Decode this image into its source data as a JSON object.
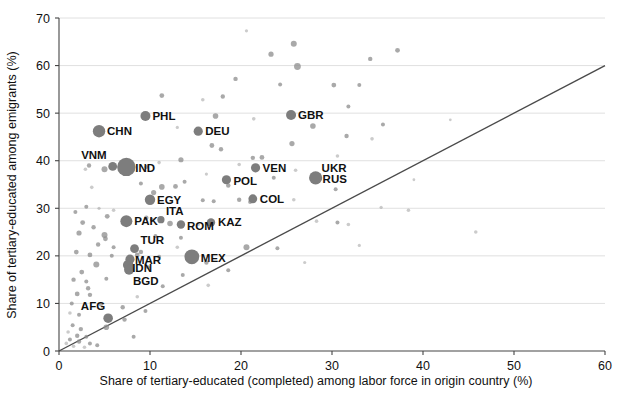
{
  "chart_data": {
    "type": "scatter",
    "title": "",
    "xlabel": "Share of tertiary-educated (completed) among labor force in origin country (%)",
    "ylabel": "Share of tertiary-educated among emigrants (%)",
    "xlim": [
      0,
      60
    ],
    "ylim": [
      0,
      70
    ],
    "xticks": [
      0,
      10,
      20,
      30,
      40,
      50,
      60
    ],
    "yticks": [
      0,
      10,
      20,
      30,
      40,
      50,
      60,
      70
    ],
    "grid": "horizontal",
    "legend": "none",
    "annotations": [
      {
        "label": "45-degree reference line",
        "from": [
          0,
          0
        ],
        "to": [
          60,
          60
        ]
      }
    ],
    "labeled_points": [
      {
        "code": "PHL",
        "x": 9.5,
        "y": 49.4,
        "size": 5.0,
        "label_dx": 7,
        "label_dy": 4
      },
      {
        "code": "CHN",
        "x": 4.4,
        "y": 46.2,
        "size": 6.2,
        "label_dx": 8,
        "label_dy": 4
      },
      {
        "code": "DEU",
        "x": 15.3,
        "y": 46.2,
        "size": 4.6,
        "label_dx": 7,
        "label_dy": 4
      },
      {
        "code": "GBR",
        "x": 25.5,
        "y": 49.6,
        "size": 5.0,
        "label_dx": 7,
        "label_dy": 4
      },
      {
        "code": "VNM",
        "x": 5.9,
        "y": 38.8,
        "size": 4.4,
        "label_dx": -6,
        "label_dy": -7
      },
      {
        "code": "IND",
        "x": 7.4,
        "y": 38.7,
        "size": 9.2,
        "label_dx": 9,
        "label_dy": 5
      },
      {
        "code": "VEN",
        "x": 21.6,
        "y": 38.5,
        "size": 4.6,
        "label_dx": 7,
        "label_dy": 4
      },
      {
        "code": "POL",
        "x": 18.4,
        "y": 36.0,
        "size": 4.6,
        "label_dx": 7,
        "label_dy": 5
      },
      {
        "code": "UKR",
        "x": 28.2,
        "y": 36.4,
        "size": 4.6,
        "label_dx": 6,
        "label_dy": -6
      },
      {
        "code": "RUS",
        "x": 28.2,
        "y": 36.4,
        "size": 6.6,
        "label_dx": 7,
        "label_dy": 5
      },
      {
        "code": "COL",
        "x": 21.3,
        "y": 32.0,
        "size": 4.4,
        "label_dx": 7,
        "label_dy": 4
      },
      {
        "code": "EGY",
        "x": 10.0,
        "y": 31.8,
        "size": 5.2,
        "label_dx": 7,
        "label_dy": 4
      },
      {
        "code": "PAK",
        "x": 7.4,
        "y": 27.3,
        "size": 6.0,
        "label_dx": 8,
        "label_dy": 4
      },
      {
        "code": "ITA",
        "x": 11.2,
        "y": 27.6,
        "size": 3.6,
        "label_dx": 5,
        "label_dy": -5
      },
      {
        "code": "ROM",
        "x": 13.4,
        "y": 26.6,
        "size": 4.2,
        "label_dx": 6,
        "label_dy": 6
      },
      {
        "code": "KAZ",
        "x": 16.7,
        "y": 27.0,
        "size": 4.2,
        "label_dx": 7,
        "label_dy": 3
      },
      {
        "code": "TUR",
        "x": 8.3,
        "y": 21.5,
        "size": 4.4,
        "label_dx": 6,
        "label_dy": -5
      },
      {
        "code": "MAR",
        "x": 7.8,
        "y": 19.3,
        "size": 4.6,
        "label_dx": 5,
        "label_dy": 5
      },
      {
        "code": "MEX",
        "x": 14.6,
        "y": 19.8,
        "size": 7.4,
        "label_dx": 9,
        "label_dy": 5
      },
      {
        "code": "IDN",
        "x": 7.6,
        "y": 18.1,
        "size": 5.2,
        "label_dx": 4,
        "label_dy": 7
      },
      {
        "code": "BGD",
        "x": 7.7,
        "y": 17.1,
        "size": 5.0,
        "label_dx": 4,
        "label_dy": 15
      },
      {
        "code": "AFG",
        "x": 5.4,
        "y": 6.9,
        "size": 4.8,
        "label_dx": -3,
        "label_dy": -8
      }
    ],
    "background_points": [
      {
        "x": 34.2,
        "y": 61.4,
        "size": 2.2
      },
      {
        "x": 37.2,
        "y": 63.2,
        "size": 2.4
      },
      {
        "x": 25.8,
        "y": 64.6,
        "size": 3.0
      },
      {
        "x": 23.3,
        "y": 62.4,
        "size": 2.6
      },
      {
        "x": 26.2,
        "y": 59.8,
        "size": 3.4
      },
      {
        "x": 20.6,
        "y": 67.3,
        "size": 1.6
      },
      {
        "x": 19.4,
        "y": 57.2,
        "size": 2.2
      },
      {
        "x": 24.3,
        "y": 56.0,
        "size": 2.0
      },
      {
        "x": 30.2,
        "y": 55.9,
        "size": 2.4
      },
      {
        "x": 33.0,
        "y": 55.9,
        "size": 2.0
      },
      {
        "x": 11.3,
        "y": 53.7,
        "size": 2.4
      },
      {
        "x": 15.8,
        "y": 52.8,
        "size": 1.8
      },
      {
        "x": 18.0,
        "y": 53.5,
        "size": 2.2
      },
      {
        "x": 31.8,
        "y": 51.4,
        "size": 2.0
      },
      {
        "x": 17.2,
        "y": 49.4,
        "size": 2.8
      },
      {
        "x": 21.4,
        "y": 48.8,
        "size": 1.8
      },
      {
        "x": 27.9,
        "y": 47.3,
        "size": 2.8
      },
      {
        "x": 35.6,
        "y": 47.6,
        "size": 2.0
      },
      {
        "x": 13.0,
        "y": 47.0,
        "size": 1.6
      },
      {
        "x": 31.6,
        "y": 45.2,
        "size": 2.2
      },
      {
        "x": 34.4,
        "y": 44.6,
        "size": 1.8
      },
      {
        "x": 16.8,
        "y": 43.2,
        "size": 2.4
      },
      {
        "x": 17.8,
        "y": 42.4,
        "size": 2.2
      },
      {
        "x": 25.6,
        "y": 43.6,
        "size": 2.6
      },
      {
        "x": 22.3,
        "y": 40.7,
        "size": 2.4
      },
      {
        "x": 21.3,
        "y": 40.6,
        "size": 2.2
      },
      {
        "x": 30.6,
        "y": 41.0,
        "size": 1.8
      },
      {
        "x": 13.4,
        "y": 40.2,
        "size": 2.6
      },
      {
        "x": 11.0,
        "y": 39.6,
        "size": 1.8
      },
      {
        "x": 3.3,
        "y": 39.0,
        "size": 2.2
      },
      {
        "x": 2.9,
        "y": 38.2,
        "size": 1.8
      },
      {
        "x": 5.0,
        "y": 38.2,
        "size": 3.0
      },
      {
        "x": 19.8,
        "y": 39.2,
        "size": 1.8
      },
      {
        "x": 26.0,
        "y": 38.0,
        "size": 1.8
      },
      {
        "x": 9.6,
        "y": 38.7,
        "size": 2.0
      },
      {
        "x": 16.2,
        "y": 37.2,
        "size": 1.6
      },
      {
        "x": 23.6,
        "y": 36.4,
        "size": 2.0
      },
      {
        "x": 13.8,
        "y": 35.6,
        "size": 2.0
      },
      {
        "x": 9.0,
        "y": 35.2,
        "size": 2.0
      },
      {
        "x": 11.3,
        "y": 34.5,
        "size": 2.8
      },
      {
        "x": 12.8,
        "y": 34.6,
        "size": 2.4
      },
      {
        "x": 18.6,
        "y": 34.8,
        "size": 2.2
      },
      {
        "x": 30.4,
        "y": 34.0,
        "size": 2.0
      },
      {
        "x": 3.6,
        "y": 34.4,
        "size": 1.8
      },
      {
        "x": 10.4,
        "y": 33.3,
        "size": 2.6
      },
      {
        "x": 19.8,
        "y": 31.8,
        "size": 2.2
      },
      {
        "x": 21.0,
        "y": 31.3,
        "size": 2.0
      },
      {
        "x": 25.8,
        "y": 31.8,
        "size": 1.8
      },
      {
        "x": 15.8,
        "y": 31.7,
        "size": 2.0
      },
      {
        "x": 17.0,
        "y": 31.5,
        "size": 2.0
      },
      {
        "x": 3.0,
        "y": 30.3,
        "size": 2.0
      },
      {
        "x": 4.4,
        "y": 30.0,
        "size": 1.6
      },
      {
        "x": 6.0,
        "y": 29.6,
        "size": 1.8
      },
      {
        "x": 1.8,
        "y": 29.2,
        "size": 2.0
      },
      {
        "x": 5.3,
        "y": 28.3,
        "size": 2.4
      },
      {
        "x": 9.6,
        "y": 28.0,
        "size": 2.2
      },
      {
        "x": 10.2,
        "y": 27.6,
        "size": 2.0
      },
      {
        "x": 12.2,
        "y": 26.8,
        "size": 2.8
      },
      {
        "x": 15.3,
        "y": 26.6,
        "size": 1.8
      },
      {
        "x": 2.6,
        "y": 27.0,
        "size": 2.4
      },
      {
        "x": 3.8,
        "y": 26.0,
        "size": 2.2
      },
      {
        "x": 28.3,
        "y": 27.3,
        "size": 1.8
      },
      {
        "x": 30.6,
        "y": 27.0,
        "size": 2.0
      },
      {
        "x": 31.8,
        "y": 26.6,
        "size": 1.8
      },
      {
        "x": 2.2,
        "y": 24.8,
        "size": 2.6
      },
      {
        "x": 5.0,
        "y": 24.4,
        "size": 3.0
      },
      {
        "x": 5.1,
        "y": 23.6,
        "size": 2.4
      },
      {
        "x": 10.6,
        "y": 24.2,
        "size": 2.0
      },
      {
        "x": 13.4,
        "y": 23.8,
        "size": 2.0
      },
      {
        "x": 4.3,
        "y": 22.4,
        "size": 2.2
      },
      {
        "x": 6.0,
        "y": 21.8,
        "size": 2.0
      },
      {
        "x": 9.0,
        "y": 20.8,
        "size": 2.2
      },
      {
        "x": 13.0,
        "y": 21.8,
        "size": 1.8
      },
      {
        "x": 20.6,
        "y": 21.8,
        "size": 3.0
      },
      {
        "x": 1.9,
        "y": 20.8,
        "size": 2.4
      },
      {
        "x": 3.4,
        "y": 20.2,
        "size": 2.4
      },
      {
        "x": 5.8,
        "y": 20.0,
        "size": 2.0
      },
      {
        "x": 8.6,
        "y": 20.2,
        "size": 2.4
      },
      {
        "x": 11.0,
        "y": 19.8,
        "size": 2.0
      },
      {
        "x": 16.2,
        "y": 18.6,
        "size": 2.2
      },
      {
        "x": 4.1,
        "y": 18.2,
        "size": 3.0
      },
      {
        "x": 9.8,
        "y": 17.6,
        "size": 2.0
      },
      {
        "x": 2.5,
        "y": 16.6,
        "size": 2.4
      },
      {
        "x": 13.6,
        "y": 16.0,
        "size": 2.0
      },
      {
        "x": 1.6,
        "y": 15.0,
        "size": 2.2
      },
      {
        "x": 3.0,
        "y": 14.6,
        "size": 2.0
      },
      {
        "x": 5.2,
        "y": 15.2,
        "size": 2.0
      },
      {
        "x": 3.2,
        "y": 13.2,
        "size": 2.2
      },
      {
        "x": 11.4,
        "y": 13.6,
        "size": 2.0
      },
      {
        "x": 2.0,
        "y": 12.0,
        "size": 2.4
      },
      {
        "x": 3.4,
        "y": 11.8,
        "size": 2.2
      },
      {
        "x": 8.6,
        "y": 11.4,
        "size": 1.8
      },
      {
        "x": 1.4,
        "y": 10.0,
        "size": 2.0
      },
      {
        "x": 4.6,
        "y": 9.8,
        "size": 2.0
      },
      {
        "x": 7.0,
        "y": 9.2,
        "size": 2.2
      },
      {
        "x": 9.5,
        "y": 8.4,
        "size": 2.0
      },
      {
        "x": 1.2,
        "y": 8.0,
        "size": 1.8
      },
      {
        "x": 2.2,
        "y": 7.6,
        "size": 2.0
      },
      {
        "x": 5.2,
        "y": 5.0,
        "size": 2.8
      },
      {
        "x": 1.5,
        "y": 5.4,
        "size": 2.0
      },
      {
        "x": 2.4,
        "y": 4.6,
        "size": 2.2
      },
      {
        "x": 1.0,
        "y": 4.0,
        "size": 1.8
      },
      {
        "x": 2.0,
        "y": 3.2,
        "size": 2.2
      },
      {
        "x": 3.0,
        "y": 3.0,
        "size": 2.0
      },
      {
        "x": 1.2,
        "y": 2.4,
        "size": 2.0
      },
      {
        "x": 2.2,
        "y": 2.0,
        "size": 2.2
      },
      {
        "x": 0.8,
        "y": 1.6,
        "size": 1.8
      },
      {
        "x": 3.4,
        "y": 1.6,
        "size": 2.0
      },
      {
        "x": 1.6,
        "y": 1.0,
        "size": 1.8
      },
      {
        "x": 4.2,
        "y": 1.2,
        "size": 2.0
      },
      {
        "x": 2.8,
        "y": 0.8,
        "size": 1.8
      },
      {
        "x": 7.2,
        "y": 6.6,
        "size": 2.2
      },
      {
        "x": 8.2,
        "y": 3.0,
        "size": 2.0
      },
      {
        "x": 45.8,
        "y": 25.0,
        "size": 1.8
      },
      {
        "x": 35.4,
        "y": 30.2,
        "size": 1.6
      },
      {
        "x": 38.4,
        "y": 29.6,
        "size": 1.8
      },
      {
        "x": 33.0,
        "y": 22.2,
        "size": 1.6
      },
      {
        "x": 24.0,
        "y": 21.6,
        "size": 2.0
      },
      {
        "x": 27.0,
        "y": 18.6,
        "size": 1.6
      },
      {
        "x": 18.6,
        "y": 17.0,
        "size": 2.0
      },
      {
        "x": 16.4,
        "y": 13.8,
        "size": 1.8
      },
      {
        "x": 43.0,
        "y": 48.6,
        "size": 1.4
      },
      {
        "x": 39.0,
        "y": 36.0,
        "size": 1.4
      }
    ]
  },
  "axes": {
    "x_tick_labels": [
      "0",
      "10",
      "20",
      "30",
      "40",
      "50",
      "60"
    ],
    "y_tick_labels": [
      "0",
      "10",
      "20",
      "30",
      "40",
      "50",
      "60",
      "70"
    ]
  },
  "colors": {
    "point": "#8c8c8c",
    "highlight_point": "#7d7d7d",
    "grid": "#d8d8d8",
    "axis": "#444444",
    "reference_line": "#4a4a4a",
    "text": "#111111",
    "background": "#ffffff"
  }
}
